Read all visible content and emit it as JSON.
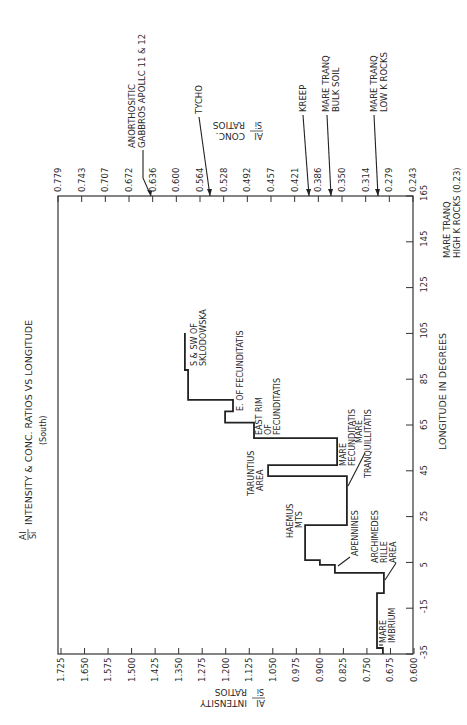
{
  "chart_data": {
    "type": "line",
    "subtype": "step",
    "orientation": "rotated-90",
    "title_fraction": {
      "numerator": "Al",
      "denominator": "Si"
    },
    "title_suffix": "INTENSITY & CONC. RATIOS VS LONGITUDE",
    "subtitle": "(South)",
    "xlabel": "LONGITUDE IN DEGREES",
    "ylabel": "Al/Si INTENSITY RATIOS",
    "ylabel_fraction": {
      "numerator": "Al",
      "denominator": "Si"
    },
    "ylabel_suffix_1": "INTENSITY",
    "ylabel_suffix_2": "RATIOS",
    "y2label": "Al/Si CONC. RATIOS",
    "y2label_fraction": {
      "numerator": "Al",
      "denominator": "Si"
    },
    "y2label_suffix_1": "CONC.",
    "y2label_suffix_2": "RATIOS",
    "xlim": [
      -35,
      165
    ],
    "ylim": [
      0.6,
      1.725
    ],
    "y2lim": [
      0.243,
      0.779
    ],
    "grid": false,
    "x_ticks": [
      "-35",
      "-15",
      "5",
      "25",
      "45",
      "65",
      "85",
      "105",
      "125",
      "145",
      "165"
    ],
    "x_tick_values": [
      -35,
      -15,
      5,
      25,
      45,
      65,
      85,
      105,
      125,
      145,
      165
    ],
    "y_ticks": [
      "1.725",
      "1.650",
      "1.575",
      "1.500",
      "1.425",
      "1.350",
      "1.275",
      "1.200",
      "1.125",
      "1.050",
      "0.975",
      "0.900",
      "0.825",
      "0.750",
      "0.675",
      "0.600"
    ],
    "y_tick_values": [
      1.725,
      1.65,
      1.575,
      1.5,
      1.425,
      1.35,
      1.275,
      1.2,
      1.125,
      1.05,
      0.975,
      0.9,
      0.825,
      0.75,
      0.675,
      0.6
    ],
    "y2_ticks": [
      "0.779",
      "0.743",
      "0.707",
      "0.672",
      "0.636",
      "0.600",
      "0.564",
      "0.528",
      "0.492",
      "0.457",
      "0.421",
      "0.386",
      "0.350",
      "0.314",
      "0.279",
      "0.243"
    ],
    "series": [
      {
        "name": "Al/Si intensity ratio (South)",
        "points": [
          {
            "lon": -35.0,
            "value": 0.699
          },
          {
            "lon": -32.4,
            "value": 0.699
          },
          {
            "lon": -32.4,
            "value": 0.718
          },
          {
            "lon": -8.4,
            "value": 0.718
          },
          {
            "lon": -8.4,
            "value": 0.696
          },
          {
            "lon": 0.4,
            "value": 0.696
          },
          {
            "lon": 0.4,
            "value": 0.852
          },
          {
            "lon": 3.9,
            "value": 0.852
          },
          {
            "lon": 3.9,
            "value": 0.9
          },
          {
            "lon": 6.0,
            "value": 0.9
          },
          {
            "lon": 6.0,
            "value": 0.947
          },
          {
            "lon": 21.3,
            "value": 0.947
          },
          {
            "lon": 21.3,
            "value": 0.814
          },
          {
            "lon": 42.7,
            "value": 0.814
          },
          {
            "lon": 42.7,
            "value": 1.065
          },
          {
            "lon": 47.5,
            "value": 1.065
          },
          {
            "lon": 47.5,
            "value": 0.845
          },
          {
            "lon": 59.3,
            "value": 0.845
          },
          {
            "lon": 59.3,
            "value": 1.11
          },
          {
            "lon": 66.0,
            "value": 1.11
          },
          {
            "lon": 66.0,
            "value": 1.202
          },
          {
            "lon": 71.0,
            "value": 1.202
          },
          {
            "lon": 71.0,
            "value": 1.177
          },
          {
            "lon": 76.0,
            "value": 1.177
          },
          {
            "lon": 76.0,
            "value": 1.32
          },
          {
            "lon": 89.0,
            "value": 1.32
          },
          {
            "lon": 89.0,
            "value": 1.33
          },
          {
            "lon": 105.2,
            "value": 1.33
          }
        ]
      }
    ],
    "region_annotations": [
      {
        "lines": [
          "MARE",
          "IMBRIUM"
        ],
        "lon": -25,
        "value": 0.7
      },
      {
        "lines": [
          "ARCHIMEDES",
          "RILLE",
          "AREA"
        ],
        "lon": -2,
        "value": 0.7
      },
      {
        "lines": [
          "APENNINES"
        ],
        "lon": 5,
        "value": 0.85
      },
      {
        "lines": [
          "HAEMUS",
          "MTS"
        ],
        "lon": 10,
        "value": 0.95
      },
      {
        "lines": [
          "MARE",
          "TRANQUILLITATIS"
        ],
        "lon": 35,
        "value": 0.81
      },
      {
        "lines": [
          "TARUNTIUS",
          "AREA"
        ],
        "lon": 45,
        "value": 1.07
      },
      {
        "lines": [
          "MARE",
          "FECUNDITATIS"
        ],
        "lon": 52,
        "value": 0.84
      },
      {
        "lines": [
          "EAST RIM",
          "OF",
          "FECUNDITATIS"
        ],
        "lon": 62,
        "value": 1.11
      },
      {
        "lines": [
          "E. OF FECUNDITATIS"
        ],
        "lon": 72,
        "value": 1.18
      },
      {
        "lines": [
          "S & SW OF",
          "SKLODOWSKA"
        ],
        "lon": 95,
        "value": 1.33
      }
    ],
    "reference_markers": [
      {
        "label": "ANORTHOSITIC GABBROS APOLLC 11 & 12",
        "lines": [
          "ANORTHOSITIC",
          "GABBROS APOLLC 11 & 12"
        ],
        "conc_ratio": 0.645
      },
      {
        "label": "TYCHO",
        "lines": [
          "TYCHO"
        ],
        "conc_ratio": 0.55
      },
      {
        "label": "KREEP",
        "lines": [
          "KREEP"
        ],
        "conc_ratio": 0.39
      },
      {
        "label": "MARE TRANQ BULK SOIL",
        "lines": [
          "MARE TRANQ",
          "BULK SOIL"
        ],
        "conc_ratio": 0.357
      },
      {
        "label": "MARE TRANQ LOW K ROCKS",
        "lines": [
          "MARE TRANQ",
          "LOW  K  ROCKS"
        ],
        "conc_ratio": 0.285
      },
      {
        "label": "MARE TRANQ HIGH K ROCKS (0.23)",
        "lines": [
          "MARE TRANQ",
          "HIGH K ROCKS (0.23)"
        ],
        "conc_ratio": 0.23
      }
    ]
  }
}
